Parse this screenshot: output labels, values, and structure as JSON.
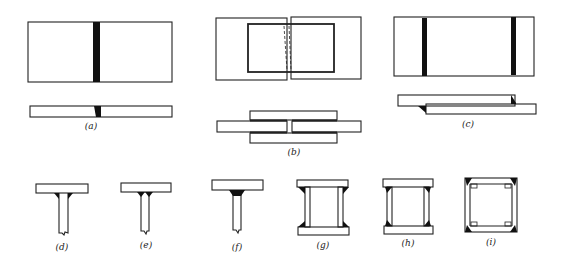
{
  "figure": {
    "stroke_color": "#222222",
    "weld_color": "#111111",
    "background": "#ffffff"
  },
  "panels": [
    {
      "id": "a",
      "label": "(a)",
      "kind": "butt-joint",
      "views": [
        "plan",
        "section"
      ]
    },
    {
      "id": "b",
      "label": "(b)",
      "kind": "double-strap-butt-joint",
      "views": [
        "plan",
        "section"
      ]
    },
    {
      "id": "c",
      "label": "(c)",
      "kind": "lap-joint",
      "views": [
        "plan",
        "section"
      ]
    },
    {
      "id": "d",
      "label": "(d)",
      "kind": "t-joint-bevel-groove"
    },
    {
      "id": "e",
      "label": "(e)",
      "kind": "t-joint-double-fillet"
    },
    {
      "id": "f",
      "label": "(f)",
      "kind": "t-joint-fillet"
    },
    {
      "id": "g",
      "label": "(g)",
      "kind": "box-section-outer-fillets"
    },
    {
      "id": "h",
      "label": "(h)",
      "kind": "box-section-side-fillets"
    },
    {
      "id": "i",
      "label": "(i)",
      "kind": "box-section-corner-welds"
    }
  ]
}
